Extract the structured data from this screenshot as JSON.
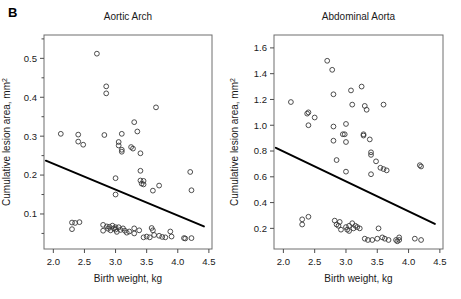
{
  "figure": {
    "panel_letter": "B",
    "background": "#ffffff",
    "marker_color": "#3a3a3a",
    "line_color": "#000000",
    "frame_color": "#6e6e6e"
  },
  "chart_data": [
    {
      "type": "scatter",
      "title": "Aortic Arch",
      "xlabel": "Birth weight, kg",
      "ylabel": "Cumulative lesion area, mm²",
      "xlim": [
        1.85,
        4.55
      ],
      "ylim": [
        0.01,
        0.56
      ],
      "xticks": [
        2.0,
        2.5,
        3.0,
        3.5,
        4.0,
        4.5
      ],
      "xtick_labels": [
        "2.0",
        "2.5",
        "3.0",
        "3.5",
        "4.0",
        "4.5"
      ],
      "yticks": [
        0.1,
        0.2,
        0.3,
        0.4,
        0.5
      ],
      "ytick_labels": [
        "0.1",
        "0.2",
        "0.3",
        "0.4",
        "0.5"
      ],
      "yticks_minor": [
        0.05,
        0.15,
        0.25,
        0.35,
        0.45,
        0.55
      ],
      "grid": false,
      "legend": null,
      "marker": "open-circle",
      "trendline": {
        "type": "linear",
        "x": [
          1.88,
          4.42
        ],
        "y": [
          0.237,
          0.068
        ],
        "slope": -0.0665,
        "intercept": 0.362
      },
      "points": [
        [
          2.12,
          0.306
        ],
        [
          2.3,
          0.078
        ],
        [
          2.3,
          0.061
        ],
        [
          2.35,
          0.077
        ],
        [
          2.4,
          0.304
        ],
        [
          2.4,
          0.286
        ],
        [
          2.42,
          0.079
        ],
        [
          2.48,
          0.278
        ],
        [
          2.7,
          0.512
        ],
        [
          2.8,
          0.072
        ],
        [
          2.8,
          0.057
        ],
        [
          2.82,
          0.303
        ],
        [
          2.85,
          0.428
        ],
        [
          2.85,
          0.41
        ],
        [
          2.86,
          0.068
        ],
        [
          2.88,
          0.062
        ],
        [
          2.9,
          0.067
        ],
        [
          2.92,
          0.058
        ],
        [
          2.95,
          0.07
        ],
        [
          2.97,
          0.063
        ],
        [
          3.0,
          0.192
        ],
        [
          3.0,
          0.15
        ],
        [
          3.0,
          0.066
        ],
        [
          3.0,
          0.06
        ],
        [
          3.02,
          0.054
        ],
        [
          3.05,
          0.285
        ],
        [
          3.05,
          0.276
        ],
        [
          3.05,
          0.066
        ],
        [
          3.08,
          0.059
        ],
        [
          3.1,
          0.306
        ],
        [
          3.1,
          0.265
        ],
        [
          3.1,
          0.26
        ],
        [
          3.12,
          0.063
        ],
        [
          3.15,
          0.057
        ],
        [
          3.18,
          0.052
        ],
        [
          3.22,
          0.055
        ],
        [
          3.25,
          0.272
        ],
        [
          3.28,
          0.268
        ],
        [
          3.3,
          0.336
        ],
        [
          3.3,
          0.063
        ],
        [
          3.3,
          0.05
        ],
        [
          3.35,
          0.312
        ],
        [
          3.38,
          0.058
        ],
        [
          3.4,
          0.256
        ],
        [
          3.4,
          0.211
        ],
        [
          3.4,
          0.186
        ],
        [
          3.42,
          0.178
        ],
        [
          3.45,
          0.185
        ],
        [
          3.45,
          0.176
        ],
        [
          3.45,
          0.04
        ],
        [
          3.5,
          0.042
        ],
        [
          3.55,
          0.04
        ],
        [
          3.58,
          0.064
        ],
        [
          3.6,
          0.16
        ],
        [
          3.6,
          0.058
        ],
        [
          3.62,
          0.046
        ],
        [
          3.65,
          0.374
        ],
        [
          3.7,
          0.173
        ],
        [
          3.7,
          0.044
        ],
        [
          3.75,
          0.041
        ],
        [
          3.8,
          0.04
        ],
        [
          3.88,
          0.055
        ],
        [
          3.9,
          0.042
        ],
        [
          4.1,
          0.038
        ],
        [
          4.12,
          0.037
        ],
        [
          4.2,
          0.208
        ],
        [
          4.22,
          0.161
        ],
        [
          4.22,
          0.038
        ]
      ]
    },
    {
      "type": "scatter",
      "title": "Abdominal Aorta",
      "xlabel": "Birth weight, kg",
      "ylabel": "Cumulative lesion area, mm²",
      "xlim": [
        1.85,
        4.55
      ],
      "ylim": [
        0.04,
        1.7
      ],
      "xticks": [
        2.0,
        2.5,
        3.0,
        3.5,
        4.0,
        4.5
      ],
      "xtick_labels": [
        "2.0",
        "2.5",
        "3.0",
        "3.5",
        "4.0",
        "4.5"
      ],
      "yticks": [
        0.2,
        0.4,
        0.6,
        0.8,
        1.0,
        1.2,
        1.4,
        1.6
      ],
      "ytick_labels": [
        "0.2",
        "0.4",
        "0.6",
        "0.8",
        "1.0",
        "1.2",
        "1.4",
        "1.6"
      ],
      "grid": false,
      "legend": null,
      "marker": "open-circle",
      "trendline": {
        "type": "linear",
        "x": [
          1.88,
          4.42
        ],
        "y": [
          0.825,
          0.235
        ],
        "slope": -0.232,
        "intercept": 1.262
      },
      "points": [
        [
          2.12,
          1.18
        ],
        [
          2.3,
          0.27
        ],
        [
          2.3,
          0.23
        ],
        [
          2.38,
          1.09
        ],
        [
          2.4,
          1.1
        ],
        [
          2.4,
          1.0
        ],
        [
          2.4,
          0.29
        ],
        [
          2.5,
          1.06
        ],
        [
          2.7,
          1.5
        ],
        [
          2.78,
          1.43
        ],
        [
          2.8,
          1.24
        ],
        [
          2.8,
          0.99
        ],
        [
          2.8,
          0.88
        ],
        [
          2.82,
          0.26
        ],
        [
          2.85,
          0.73
        ],
        [
          2.85,
          0.23
        ],
        [
          2.88,
          0.22
        ],
        [
          2.9,
          0.25
        ],
        [
          2.92,
          0.19
        ],
        [
          2.95,
          0.93
        ],
        [
          2.98,
          0.93
        ],
        [
          3.0,
          1.01
        ],
        [
          3.0,
          0.87
        ],
        [
          3.0,
          0.64
        ],
        [
          3.0,
          0.21
        ],
        [
          3.02,
          0.19
        ],
        [
          3.05,
          0.22
        ],
        [
          3.05,
          0.18
        ],
        [
          3.08,
          1.27
        ],
        [
          3.1,
          1.16
        ],
        [
          3.1,
          0.24
        ],
        [
          3.12,
          0.2
        ],
        [
          3.15,
          0.22
        ],
        [
          3.18,
          0.21
        ],
        [
          3.22,
          0.2
        ],
        [
          3.25,
          1.3
        ],
        [
          3.28,
          0.93
        ],
        [
          3.28,
          0.92
        ],
        [
          3.3,
          1.15
        ],
        [
          3.3,
          0.12
        ],
        [
          3.33,
          1.12
        ],
        [
          3.35,
          0.11
        ],
        [
          3.38,
          0.89
        ],
        [
          3.4,
          0.79
        ],
        [
          3.4,
          0.77
        ],
        [
          3.4,
          0.62
        ],
        [
          3.42,
          0.11
        ],
        [
          3.48,
          0.72
        ],
        [
          3.5,
          0.12
        ],
        [
          3.52,
          0.2
        ],
        [
          3.55,
          0.67
        ],
        [
          3.58,
          0.13
        ],
        [
          3.6,
          1.16
        ],
        [
          3.6,
          0.66
        ],
        [
          3.62,
          0.12
        ],
        [
          3.65,
          0.65
        ],
        [
          3.68,
          0.11
        ],
        [
          3.8,
          0.11
        ],
        [
          3.82,
          0.1
        ],
        [
          3.85,
          0.13
        ],
        [
          3.85,
          0.11
        ],
        [
          4.1,
          0.12
        ],
        [
          4.18,
          0.69
        ],
        [
          4.2,
          0.68
        ],
        [
          4.2,
          0.11
        ]
      ]
    }
  ]
}
